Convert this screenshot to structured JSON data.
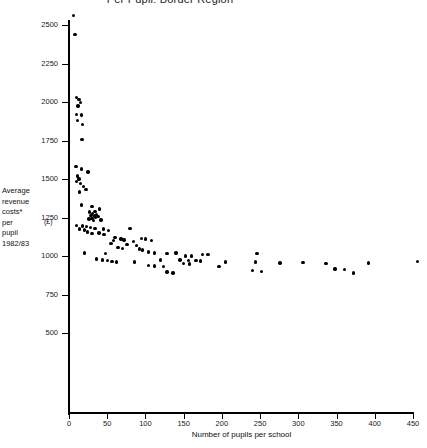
{
  "chart_data": {
    "type": "scatter",
    "title": "Per Pupil: Border Region",
    "xlabel": "Number of pupils per school",
    "ylabel": "Average revenue costs* per pupil 1982/83",
    "yunit": "(£)",
    "xlim": [
      0,
      460
    ],
    "ylim": [
      430,
      2600
    ],
    "xticks": [
      0,
      50,
      100,
      150,
      200,
      250,
      300,
      350,
      400,
      450
    ],
    "xtick_labels": [
      "0",
      "50",
      "100",
      "150",
      "200",
      "250",
      "300",
      "350",
      "400",
      "450"
    ],
    "yticks": [
      500,
      750,
      1000,
      1250,
      1500,
      1750,
      2000,
      2250,
      2500
    ],
    "ytick_labels": [
      "500",
      "750",
      "1000",
      "1250",
      "1500",
      "1750",
      "2000",
      "2250",
      "2500"
    ],
    "grid": false,
    "legend": null,
    "marker": "filled-circle",
    "marker_color": "#000000",
    "points": [
      [
        6,
        2560
      ],
      [
        8,
        2440
      ],
      [
        10,
        2030
      ],
      [
        13,
        2015
      ],
      [
        15,
        1995
      ],
      [
        12,
        1975
      ],
      [
        10,
        1920
      ],
      [
        16,
        1915
      ],
      [
        11,
        1880
      ],
      [
        18,
        1855
      ],
      [
        17,
        1755
      ],
      [
        9,
        1580
      ],
      [
        16,
        1565
      ],
      [
        25,
        1545
      ],
      [
        11,
        1520
      ],
      [
        13,
        1500
      ],
      [
        10,
        1485
      ],
      [
        15,
        1470
      ],
      [
        19,
        1450
      ],
      [
        22,
        1430
      ],
      [
        14,
        1415
      ],
      [
        16,
        1330
      ],
      [
        30,
        1320
      ],
      [
        40,
        1305
      ],
      [
        34,
        1290
      ],
      [
        27,
        1285
      ],
      [
        31,
        1275
      ],
      [
        36,
        1270
      ],
      [
        29,
        1265
      ],
      [
        33,
        1260
      ],
      [
        38,
        1255
      ],
      [
        35,
        1250
      ],
      [
        30,
        1245
      ],
      [
        26,
        1240
      ],
      [
        42,
        1235
      ],
      [
        32,
        1230
      ],
      [
        10,
        1200
      ],
      [
        18,
        1195
      ],
      [
        23,
        1190
      ],
      [
        28,
        1185
      ],
      [
        34,
        1180
      ],
      [
        14,
        1175
      ],
      [
        20,
        1170
      ],
      [
        45,
        1175
      ],
      [
        52,
        1165
      ],
      [
        24,
        1155
      ],
      [
        39,
        1150
      ],
      [
        30,
        1145
      ],
      [
        46,
        1140
      ],
      [
        80,
        1180
      ],
      [
        60,
        1120
      ],
      [
        68,
        1110
      ],
      [
        72,
        1105
      ],
      [
        95,
        1115
      ],
      [
        100,
        1110
      ],
      [
        58,
        1100
      ],
      [
        84,
        1095
      ],
      [
        108,
        1100
      ],
      [
        55,
        1080
      ],
      [
        76,
        1075
      ],
      [
        88,
        1070
      ],
      [
        64,
        1055
      ],
      [
        70,
        1050
      ],
      [
        92,
        1045
      ],
      [
        96,
        1040
      ],
      [
        20,
        1020
      ],
      [
        48,
        1015
      ],
      [
        104,
        1025
      ],
      [
        112,
        1020
      ],
      [
        128,
        1015
      ],
      [
        140,
        1020
      ],
      [
        36,
        980
      ],
      [
        44,
        975
      ],
      [
        50,
        970
      ],
      [
        56,
        965
      ],
      [
        62,
        960
      ],
      [
        120,
        975
      ],
      [
        86,
        960
      ],
      [
        152,
        1000
      ],
      [
        160,
        1000
      ],
      [
        175,
        1010
      ],
      [
        182,
        1008
      ],
      [
        246,
        1015
      ],
      [
        145,
        975
      ],
      [
        156,
        970
      ],
      [
        166,
        972
      ],
      [
        172,
        968
      ],
      [
        150,
        950
      ],
      [
        158,
        948
      ],
      [
        205,
        960
      ],
      [
        244,
        962
      ],
      [
        276,
        955
      ],
      [
        306,
        958
      ],
      [
        336,
        952
      ],
      [
        392,
        955
      ],
      [
        104,
        940
      ],
      [
        112,
        935
      ],
      [
        124,
        930
      ],
      [
        196,
        930
      ],
      [
        240,
        905
      ],
      [
        252,
        900
      ],
      [
        348,
        915
      ],
      [
        360,
        912
      ],
      [
        372,
        890
      ],
      [
        128,
        895
      ],
      [
        136,
        890
      ],
      [
        456,
        965
      ]
    ]
  }
}
